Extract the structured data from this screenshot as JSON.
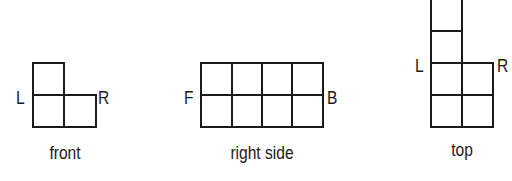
{
  "views": [
    {
      "id": "front",
      "caption": "front",
      "left_label": "L",
      "right_label": "R",
      "cells": [
        [
          0,
          0
        ],
        [
          0,
          1
        ],
        [
          1,
          1
        ]
      ],
      "grid_cols": 2,
      "grid_rows": 2
    },
    {
      "id": "right-side",
      "caption": "right side",
      "left_label": "F",
      "right_label": "B",
      "cells": [
        [
          0,
          0
        ],
        [
          1,
          0
        ],
        [
          2,
          0
        ],
        [
          3,
          0
        ],
        [
          0,
          1
        ],
        [
          1,
          1
        ],
        [
          2,
          1
        ],
        [
          3,
          1
        ]
      ],
      "grid_cols": 4,
      "grid_rows": 2
    },
    {
      "id": "top",
      "caption": "top",
      "left_label": "L",
      "right_label": "R",
      "cells": [
        [
          0,
          0
        ],
        [
          0,
          1
        ],
        [
          0,
          2
        ],
        [
          1,
          2
        ],
        [
          0,
          3
        ],
        [
          1,
          3
        ]
      ],
      "grid_cols": 2,
      "grid_rows": 4
    }
  ],
  "colors": {
    "line": "#1a1a1a",
    "background": "#ffffff"
  }
}
